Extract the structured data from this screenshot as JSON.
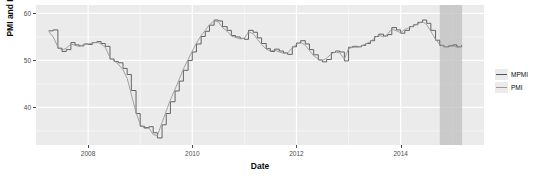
{
  "chart_data": {
    "type": "line",
    "title": "",
    "xlabel": "Date",
    "ylabel": "PMI and MPMI",
    "grid": true,
    "legend_position": "right",
    "xlim": [
      2007.0,
      2015.6
    ],
    "ylim": [
      32.0,
      61.8
    ],
    "xticks": [
      2008,
      2010,
      2012,
      2014
    ],
    "xtick_labels": [
      "2008",
      "2010",
      "2012",
      "2014"
    ],
    "yticks": [
      40,
      50,
      60
    ],
    "ytick_labels": [
      "40",
      "50",
      "60"
    ],
    "shaded_band": {
      "label": "",
      "x_start": 2014.75,
      "x_end": 2015.18,
      "color": "#bfbfbf"
    },
    "series": [
      {
        "name": "MPMI",
        "color": "#555555",
        "style": "step",
        "x": [
          2007.25,
          2007.33,
          2007.42,
          2007.5,
          2007.58,
          2007.67,
          2007.75,
          2007.83,
          2007.92,
          2008.0,
          2008.08,
          2008.17,
          2008.25,
          2008.33,
          2008.42,
          2008.5,
          2008.58,
          2008.67,
          2008.75,
          2008.83,
          2008.92,
          2009.0,
          2009.08,
          2009.17,
          2009.25,
          2009.33,
          2009.42,
          2009.5,
          2009.58,
          2009.67,
          2009.75,
          2009.83,
          2009.92,
          2010.0,
          2010.08,
          2010.17,
          2010.25,
          2010.33,
          2010.42,
          2010.5,
          2010.58,
          2010.67,
          2010.75,
          2010.83,
          2010.92,
          2011.0,
          2011.08,
          2011.17,
          2011.25,
          2011.33,
          2011.42,
          2011.5,
          2011.58,
          2011.67,
          2011.75,
          2011.83,
          2011.92,
          2012.0,
          2012.08,
          2012.17,
          2012.25,
          2012.33,
          2012.42,
          2012.5,
          2012.58,
          2012.67,
          2012.75,
          2012.83,
          2012.92,
          2013.0,
          2013.08,
          2013.17,
          2013.25,
          2013.33,
          2013.42,
          2013.5,
          2013.58,
          2013.67,
          2013.75,
          2013.83,
          2013.92,
          2014.0,
          2014.08,
          2014.17,
          2014.25,
          2014.33,
          2014.42,
          2014.5,
          2014.58,
          2014.67,
          2014.75,
          2014.83,
          2014.92,
          2015.0,
          2015.08,
          2015.17
        ],
        "y": [
          56.3,
          56.5,
          52.6,
          51.9,
          52.3,
          53.8,
          53.3,
          53.1,
          53.5,
          53.4,
          53.8,
          54.0,
          53.6,
          53.0,
          50.3,
          49.8,
          49.5,
          48.3,
          47.0,
          43.6,
          38.7,
          36.0,
          35.7,
          35.9,
          34.6,
          33.5,
          36.3,
          38.7,
          41.2,
          43.5,
          45.6,
          47.9,
          50.0,
          51.8,
          53.5,
          55.1,
          56.2,
          57.5,
          58.6,
          58.4,
          57.2,
          56.4,
          55.3,
          55.0,
          54.7,
          54.5,
          56.4,
          56.0,
          54.8,
          53.6,
          52.5,
          51.9,
          52.4,
          52.0,
          51.6,
          51.3,
          52.9,
          53.7,
          54.2,
          53.5,
          52.3,
          51.2,
          50.1,
          49.7,
          50.2,
          51.7,
          52.0,
          51.8,
          49.9,
          52.8,
          53.0,
          52.9,
          53.2,
          53.6,
          54.2,
          55.1,
          55.6,
          55.2,
          55.5,
          57.0,
          56.5,
          55.8,
          56.4,
          57.2,
          57.6,
          58.1,
          58.6,
          57.9,
          56.4,
          54.3,
          53.2,
          52.9,
          53.1,
          53.3,
          52.9,
          53.2
        ]
      },
      {
        "name": "PMI",
        "color": "#9a9a9a",
        "style": "smooth",
        "x": [
          2007.25,
          2007.33,
          2007.42,
          2007.5,
          2007.58,
          2007.67,
          2007.75,
          2007.83,
          2007.92,
          2008.0,
          2008.08,
          2008.17,
          2008.25,
          2008.33,
          2008.42,
          2008.5,
          2008.58,
          2008.67,
          2008.75,
          2008.83,
          2008.92,
          2009.0,
          2009.08,
          2009.17,
          2009.25,
          2009.33,
          2009.42,
          2009.5,
          2009.58,
          2009.67,
          2009.75,
          2009.83,
          2009.92,
          2010.0,
          2010.08,
          2010.17,
          2010.25,
          2010.33,
          2010.42,
          2010.5,
          2010.58,
          2010.67,
          2010.75,
          2010.83,
          2010.92,
          2011.0,
          2011.08,
          2011.17,
          2011.25,
          2011.33,
          2011.42,
          2011.5,
          2011.58,
          2011.67,
          2011.75,
          2011.83,
          2011.92,
          2012.0,
          2012.08,
          2012.17,
          2012.25,
          2012.33,
          2012.42,
          2012.5,
          2012.58,
          2012.67,
          2012.75,
          2012.83,
          2012.92,
          2013.0,
          2013.08,
          2013.17,
          2013.25,
          2013.33,
          2013.42,
          2013.5,
          2013.58,
          2013.67,
          2013.75,
          2013.83,
          2013.92,
          2014.0,
          2014.08,
          2014.17,
          2014.25,
          2014.33,
          2014.42,
          2014.5,
          2014.58,
          2014.67,
          2014.75,
          2014.83,
          2014.92,
          2015.0,
          2015.08,
          2015.17
        ],
        "y": [
          56.1,
          55.0,
          52.9,
          52.2,
          52.6,
          53.5,
          53.2,
          53.0,
          53.4,
          53.5,
          53.7,
          53.9,
          53.5,
          52.8,
          50.6,
          49.9,
          49.2,
          48.0,
          46.2,
          42.8,
          38.9,
          36.4,
          35.5,
          35.6,
          34.2,
          34.0,
          36.8,
          39.2,
          41.6,
          43.9,
          46.0,
          48.2,
          50.2,
          52.0,
          53.7,
          55.3,
          56.4,
          57.6,
          58.4,
          58.2,
          57.0,
          56.2,
          55.2,
          54.9,
          54.6,
          54.7,
          56.1,
          55.7,
          54.5,
          53.4,
          52.4,
          52.0,
          52.2,
          51.8,
          51.5,
          51.6,
          52.7,
          53.4,
          53.9,
          53.2,
          52.1,
          51.0,
          50.3,
          50.0,
          50.5,
          51.4,
          51.8,
          51.6,
          50.3,
          52.5,
          52.8,
          52.8,
          53.1,
          53.5,
          54.0,
          54.8,
          55.4,
          55.0,
          55.6,
          56.7,
          56.3,
          55.9,
          56.6,
          57.0,
          57.4,
          57.8,
          58.3,
          57.6,
          56.2,
          54.5,
          53.4,
          53.0,
          52.9,
          53.1,
          52.8,
          53.0
        ]
      }
    ]
  },
  "legend": {
    "items": [
      {
        "label": "MPMI",
        "color": "#555555"
      },
      {
        "label": "PMI",
        "color": "#9a9a9a"
      }
    ]
  },
  "panel": {
    "background": "#ebebeb",
    "gridline_major": "#ffffff",
    "gridline_minor": "#f5f5f5"
  }
}
